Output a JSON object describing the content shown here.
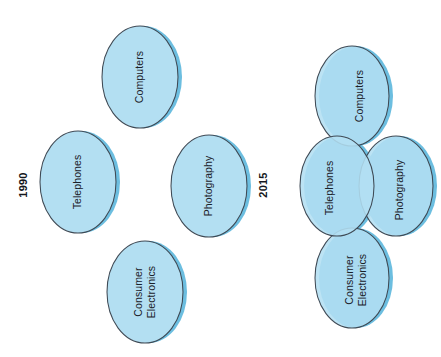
{
  "figure": {
    "orientation": "rotated-90-ccw",
    "background_color": "#ffffff",
    "ellipse_fill_color": "#b3dff2",
    "ellipse_shadow_color": "#6cbee0",
    "ellipse_outline_color": "#3f4a55",
    "label_text_color": "#1b2129"
  },
  "groups": [
    {
      "id": "group-1990",
      "label": "1990",
      "arrangement": "separate",
      "ellipses": [
        {
          "id": "computers",
          "label": "Computers",
          "label_lines": [
            "Computers"
          ],
          "position": "top"
        },
        {
          "id": "telephones",
          "label": "Telephones",
          "label_lines": [
            "Telephones"
          ],
          "position": "left"
        },
        {
          "id": "photography",
          "label": "Photography",
          "label_lines": [
            "Photography"
          ],
          "position": "right"
        },
        {
          "id": "consumer-electronics",
          "label": "Consumer Electronics",
          "label_lines": [
            "Consumer",
            "Electronics"
          ],
          "position": "bottom"
        }
      ]
    },
    {
      "id": "group-2015",
      "label": "2015",
      "arrangement": "overlapping",
      "ellipses": [
        {
          "id": "computers",
          "label": "Computers",
          "label_lines": [
            "Computers"
          ],
          "position": "top"
        },
        {
          "id": "telephones",
          "label": "Telephones",
          "label_lines": [
            "Telephones"
          ],
          "position": "left"
        },
        {
          "id": "photography",
          "label": "Photography",
          "label_lines": [
            "Photography"
          ],
          "position": "right"
        },
        {
          "id": "consumer-electronics",
          "label": "Consumer Electronics",
          "label_lines": [
            "Consumer",
            "Electronics"
          ],
          "position": "bottom"
        }
      ]
    }
  ]
}
